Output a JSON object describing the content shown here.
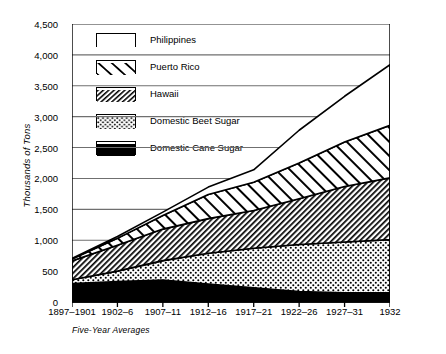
{
  "chart_data": {
    "type": "area",
    "title": "",
    "xlabel": "Five-Year Averages",
    "ylabel": "Thousands of Tons",
    "categories": [
      "1897–1901",
      "1902–6",
      "1907–11",
      "1912–16",
      "1917–21",
      "1922–26",
      "1927–31",
      "1932"
    ],
    "ylim": [
      0,
      4500
    ],
    "yticks": [
      "0",
      "500",
      "1,000",
      "1,500",
      "2,000",
      "2,500",
      "3,000",
      "3,500",
      "4,000",
      "4,500"
    ],
    "ytick_values": [
      0,
      500,
      1000,
      1500,
      2000,
      2500,
      3000,
      3500,
      4000,
      4500
    ],
    "grid": true,
    "stacked": true,
    "legend_position": "upper-left-inside",
    "series": [
      {
        "name": "Domestic Cane Sugar",
        "pattern": "solid-black",
        "values": [
          300,
          330,
          355,
          290,
          230,
          170,
          150,
          150
        ]
      },
      {
        "name": "Domestic Beet Sugar",
        "pattern": "dotted",
        "values": [
          60,
          170,
          315,
          500,
          640,
          760,
          820,
          860
        ]
      },
      {
        "name": "Hawaii",
        "pattern": "diagonal-dense-backward",
        "values": [
          305,
          420,
          510,
          560,
          610,
          740,
          900,
          1000
        ]
      },
      {
        "name": "Puerto Rico",
        "pattern": "diagonal-wide-forward",
        "values": [
          30,
          110,
          220,
          390,
          460,
          580,
          720,
          850
        ]
      },
      {
        "name": "Philippines",
        "pattern": "white",
        "values": [
          10,
          30,
          55,
          120,
          200,
          530,
          740,
          980
        ]
      }
    ],
    "cumulative_tops": {
      "Domestic Cane Sugar": [
        300,
        330,
        355,
        290,
        230,
        170,
        150,
        150
      ],
      "Domestic Beet Sugar": [
        360,
        500,
        670,
        790,
        870,
        930,
        970,
        1010
      ],
      "Hawaii": [
        665,
        920,
        1180,
        1350,
        1480,
        1670,
        1870,
        2010
      ],
      "Puerto Rico": [
        695,
        1030,
        1400,
        1740,
        1940,
        2250,
        2590,
        2860
      ],
      "Philippines": [
        705,
        1060,
        1455,
        1860,
        2140,
        2780,
        3330,
        3840
      ]
    }
  },
  "legend": {
    "items": [
      {
        "label": "Philippines"
      },
      {
        "label": "Puerto Rico"
      },
      {
        "label": "Hawaii"
      },
      {
        "label": "Domestic Beet Sugar"
      },
      {
        "label": "Domestic Cane Sugar"
      }
    ]
  },
  "axes": {
    "y_title": "Thousands of Tons",
    "x_title": "Five-Year Averages"
  },
  "colors": {
    "ink": "#000000",
    "grid": "#6f6f6f",
    "background": "#ffffff"
  }
}
